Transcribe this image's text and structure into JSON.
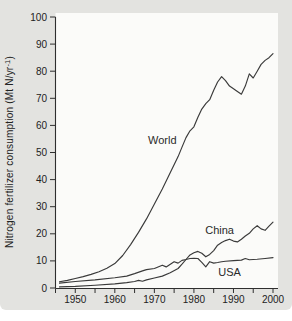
{
  "figure": {
    "ylabel_parts": {
      "pre": "Nitrogen fertilizer consumption (Mt N/yr",
      "sup": "-1",
      "post": ")"
    }
  },
  "chart_data": {
    "type": "line",
    "title": "",
    "xlabel": "",
    "ylabel": "Nitrogen fertilizer consumption (Mt N/yr⁻¹)",
    "xlim": [
      1945,
      2000
    ],
    "ylim": [
      0,
      100
    ],
    "grid": false,
    "legend_position": "inline-labels",
    "x_ticks_labeled": [
      1950,
      1960,
      1970,
      1980,
      1990,
      2000
    ],
    "x_tick_minor_interval": 5,
    "y_tick_interval": 10,
    "line_color": "#3a3a3a",
    "background_color": "#e3e3e0",
    "plot_background_color": "#fbfbf9",
    "series": [
      {
        "name": "World",
        "label_at": [
          1972,
          54.5
        ],
        "points": [
          [
            1946,
            2.3
          ],
          [
            1948,
            2.8
          ],
          [
            1950,
            3.5
          ],
          [
            1952,
            4.2
          ],
          [
            1954,
            5.0
          ],
          [
            1956,
            6.0
          ],
          [
            1958,
            7.3
          ],
          [
            1960,
            9.0
          ],
          [
            1962,
            12.0
          ],
          [
            1964,
            16.0
          ],
          [
            1966,
            20.5
          ],
          [
            1968,
            25.5
          ],
          [
            1970,
            31.0
          ],
          [
            1972,
            36.5
          ],
          [
            1974,
            42.5
          ],
          [
            1976,
            48.5
          ],
          [
            1977,
            52.0
          ],
          [
            1978,
            55.5
          ],
          [
            1979,
            58.0
          ],
          [
            1980,
            59.5
          ],
          [
            1981,
            63.0
          ],
          [
            1982,
            66.0
          ],
          [
            1983,
            68.0
          ],
          [
            1984,
            69.5
          ],
          [
            1985,
            73.0
          ],
          [
            1986,
            76.0
          ],
          [
            1987,
            78.0
          ],
          [
            1988,
            76.5
          ],
          [
            1989,
            74.5
          ],
          [
            1990,
            73.5
          ],
          [
            1991,
            72.5
          ],
          [
            1992,
            71.5
          ],
          [
            1993,
            74.5
          ],
          [
            1994,
            79.0
          ],
          [
            1995,
            77.5
          ],
          [
            1996,
            80.0
          ],
          [
            1997,
            82.5
          ],
          [
            1998,
            84.0
          ],
          [
            1999,
            85.0
          ],
          [
            2000,
            86.5
          ]
        ]
      },
      {
        "name": "China",
        "label_at": [
          1986.5,
          21.4
        ],
        "points": [
          [
            1946,
            0.4
          ],
          [
            1950,
            0.6
          ],
          [
            1955,
            1.0
          ],
          [
            1960,
            1.5
          ],
          [
            1963,
            2.0
          ],
          [
            1965,
            2.4
          ],
          [
            1966,
            2.8
          ],
          [
            1967,
            2.5
          ],
          [
            1968,
            3.0
          ],
          [
            1970,
            3.7
          ],
          [
            1972,
            4.4
          ],
          [
            1974,
            5.6
          ],
          [
            1976,
            7.2
          ],
          [
            1977,
            8.8
          ],
          [
            1978,
            10.5
          ],
          [
            1979,
            12.2
          ],
          [
            1980,
            13.0
          ],
          [
            1981,
            13.5
          ],
          [
            1982,
            12.8
          ],
          [
            1983,
            11.5
          ],
          [
            1984,
            12.4
          ],
          [
            1985,
            13.8
          ],
          [
            1986,
            15.8
          ],
          [
            1987,
            16.8
          ],
          [
            1988,
            17.5
          ],
          [
            1989,
            18.0
          ],
          [
            1990,
            17.3
          ],
          [
            1991,
            17.0
          ],
          [
            1992,
            18.0
          ],
          [
            1993,
            19.2
          ],
          [
            1994,
            20.2
          ],
          [
            1995,
            21.8
          ],
          [
            1996,
            23.0
          ],
          [
            1997,
            21.8
          ],
          [
            1998,
            21.3
          ],
          [
            1999,
            22.8
          ],
          [
            2000,
            24.3
          ]
        ]
      },
      {
        "name": "USA",
        "label_at": [
          1989,
          5.9
        ],
        "points": [
          [
            1946,
            1.8
          ],
          [
            1950,
            2.4
          ],
          [
            1955,
            3.0
          ],
          [
            1960,
            3.8
          ],
          [
            1963,
            4.4
          ],
          [
            1965,
            5.3
          ],
          [
            1967,
            6.3
          ],
          [
            1968,
            6.8
          ],
          [
            1970,
            7.2
          ],
          [
            1972,
            8.4
          ],
          [
            1973,
            7.8
          ],
          [
            1975,
            9.7
          ],
          [
            1976,
            9.2
          ],
          [
            1977,
            10.2
          ],
          [
            1978,
            10.5
          ],
          [
            1979,
            10.9
          ],
          [
            1980,
            11.0
          ],
          [
            1981,
            10.9
          ],
          [
            1982,
            9.5
          ],
          [
            1983,
            7.8
          ],
          [
            1984,
            9.7
          ],
          [
            1985,
            9.2
          ],
          [
            1986,
            9.4
          ],
          [
            1987,
            9.7
          ],
          [
            1988,
            9.9
          ],
          [
            1990,
            10.1
          ],
          [
            1992,
            10.3
          ],
          [
            1993,
            10.9
          ],
          [
            1994,
            10.4
          ],
          [
            1996,
            10.6
          ],
          [
            1998,
            10.9
          ],
          [
            2000,
            11.2
          ]
        ]
      }
    ]
  }
}
